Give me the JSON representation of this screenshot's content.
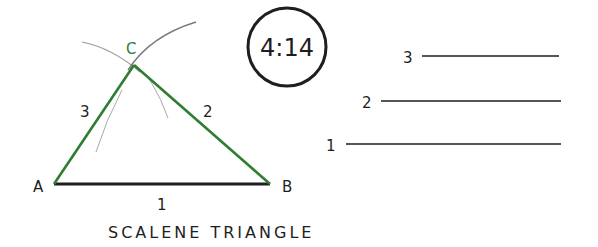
{
  "figure": {
    "badge": "4:14",
    "title": "SCALENE TRIANGLE",
    "vertices": [
      {
        "label": "A",
        "x": 54,
        "y": 184
      },
      {
        "label": "B",
        "x": 270,
        "y": 184
      },
      {
        "label": "C",
        "x": 134,
        "y": 65
      }
    ],
    "sides": [
      {
        "label": "1",
        "from": "A",
        "to": "B",
        "color": "#1e1e1e"
      },
      {
        "label": "2",
        "from": "C",
        "to": "B",
        "color": "#2f7d32"
      },
      {
        "label": "3",
        "from": "A",
        "to": "C",
        "color": "#2f7d32"
      }
    ],
    "reference_lines": [
      {
        "label": "3",
        "y": 56,
        "x1": 422,
        "x2": 559
      },
      {
        "label": "2",
        "y": 101,
        "x1": 381,
        "x2": 561
      },
      {
        "label": "1",
        "y": 144,
        "x1": 346,
        "x2": 561
      }
    ]
  }
}
